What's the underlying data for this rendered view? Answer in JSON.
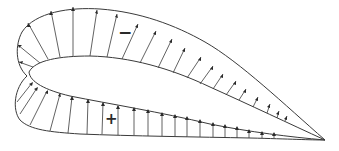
{
  "diagram": {
    "colors": {
      "stroke": "#3a3a3a",
      "background": "#ffffff"
    },
    "labels": {
      "suction_sign": "−",
      "pressure_sign": "+"
    },
    "regions": [
      {
        "name": "upper-surface-suction",
        "sign": "−"
      },
      {
        "name": "lower-surface-pressure",
        "sign": "+"
      }
    ]
  }
}
